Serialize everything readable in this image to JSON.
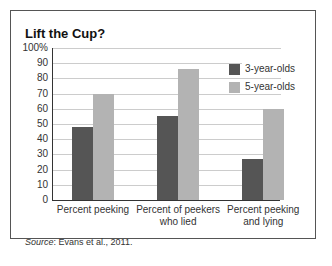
{
  "chart_data": {
    "type": "bar",
    "title": "Lift the Cup?",
    "categories": [
      "Percent peeking",
      "Percent of peekers who lied",
      "Percent peeking and lying"
    ],
    "category_lines": [
      [
        "Percent peeking"
      ],
      [
        "Percent of peekers",
        "who lied"
      ],
      [
        "Percent peeking",
        "and lying"
      ]
    ],
    "series": [
      {
        "name": "3-year-olds",
        "color": "#555555",
        "values": [
          48,
          55,
          27
        ]
      },
      {
        "name": "5-year-olds",
        "color": "#b3b3b3",
        "values": [
          70,
          86,
          60
        ]
      }
    ],
    "yticks": [
      "0",
      "10",
      "20",
      "30",
      "40",
      "50",
      "60",
      "70",
      "80",
      "90",
      "100%"
    ],
    "ylim": [
      0,
      100
    ],
    "xlabel": "",
    "ylabel": "",
    "grid": true,
    "legend_position": "upper right",
    "source_label": "Source",
    "source_text": ": Evans et al., 2011."
  }
}
